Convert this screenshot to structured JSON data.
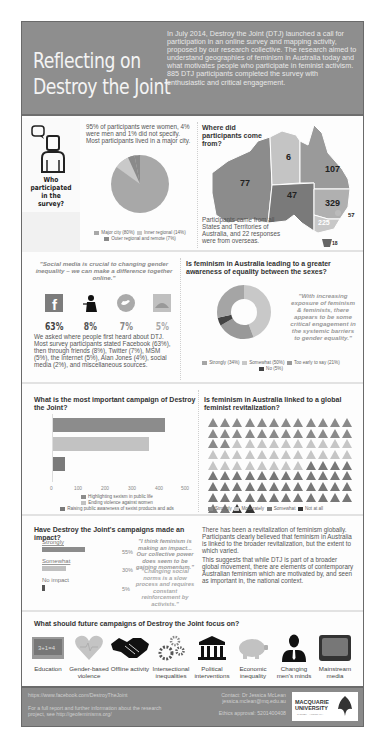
{
  "header": {
    "title": "Reflecting on Destroy the Joint",
    "intro": "In July 2014, Destroy the Joint (DTJ) launched a call for participation in an online survey and mapping activity, proposed by our research collective. The research aimed to understand geographies of feminism in Australia today and what motivates people who participate in feminist activism. 885 DTJ participants completed the survey with enthusiastic and critical engagement."
  },
  "who": {
    "label": "Who participated in the survey?",
    "text": "95% of participants were women, 4% were men and 1% did not specify. Most participants lived in a major city.",
    "legend": [
      "Major city (80%)",
      "Inner regional (14%)",
      "Outer regional and remote (7%)"
    ]
  },
  "where": {
    "title": "Where did participants come from?",
    "states": {
      "WA": "77",
      "NT": "6",
      "QLD": "107",
      "SA": "47",
      "NSW": "329",
      "ACT": "57",
      "VIC": "225",
      "TAS": "18"
    },
    "text": "Participants came from all States and Territories of Australia, and 22 responses were from overseas."
  },
  "social": {
    "quote": "\"Social media is crucial to changing gender inequality – we can make a difference together online.\"",
    "sources": [
      {
        "name": "facebook-icon",
        "pct": "63%"
      },
      {
        "name": "friends-icon",
        "pct": "8%"
      },
      {
        "name": "twitter-icon",
        "pct": "7%"
      },
      {
        "name": "msm-icon",
        "pct": "5%"
      }
    ],
    "text": "We asked where people first heard about DTJ. Most survey participants stated Facebook (63%), then through friends (8%), Twitter (7%), MSM (5%), the Internet (5%), Alan Jones (4%), social media (2%), and miscellaneous sources."
  },
  "awareness": {
    "title": "Is feminism in Australia leading to a greater awareness of equality between the sexes?",
    "quote": "\"With increasing exposure of feminism & feminists, there appears to be some critical engagement in the systemic barriers to gender equality.\"",
    "legend": [
      "Strongly (34%)",
      "Somewhat (50%)",
      "Too early to say (21%)",
      "No (5%)"
    ]
  },
  "chart_data": [
    {
      "type": "pie",
      "title": "Participant location",
      "categories": [
        "Major city",
        "Inner regional",
        "Outer regional and remote"
      ],
      "values": [
        80,
        14,
        7
      ]
    },
    {
      "type": "pie",
      "title": "Is feminism in Australia leading to a greater awareness of equality between the sexes?",
      "categories": [
        "Strongly",
        "Somewhat",
        "Too early to say",
        "No"
      ],
      "values": [
        34,
        50,
        21,
        5
      ]
    },
    {
      "type": "bar",
      "title": "What is the most important campaign of Destroy the Joint?",
      "categories": [
        "Highlighting sexism in public life",
        "Ending violence against women",
        "Raising public awareness of sexist products and ads"
      ],
      "values": [
        420,
        360,
        45
      ],
      "xlim": [
        0,
        500
      ],
      "xticks": [
        "0",
        "100",
        "200",
        "300",
        "400",
        "500"
      ]
    },
    {
      "type": "bar",
      "title": "Have Destroy the Joint's campaigns made an impact?",
      "categories": [
        "Strongly",
        "Somewhat",
        "No impact"
      ],
      "values": [
        55,
        30,
        5
      ]
    }
  ],
  "campaign": {
    "title": "What is the most important campaign of Destroy the Joint?",
    "ticks": [
      "0",
      "100",
      "200",
      "300",
      "400",
      "500"
    ],
    "legend": [
      "Highlighting sexism in public life",
      "Ending violence against women",
      "Raising public awareness of sexist products and ads"
    ]
  },
  "global": {
    "title": "Is feminism in Australia linked to a global feminist revitalization?",
    "legend": [
      "Strongly",
      "Moderately",
      "Somewhat",
      "Not at all"
    ]
  },
  "impact": {
    "title": "Have Destroy the Joint's campaigns made an impact?",
    "rows": [
      {
        "label": "Strongly",
        "pct": "55%"
      },
      {
        "label": "Somewhat",
        "pct": "30%"
      },
      {
        "label": "No impact",
        "pct": "5%"
      }
    ],
    "quote1": "\"I think feminism is making an impact... Our collective power does seem to be gaining momentum.\"",
    "quote2": "\"Changing social norms is a slow process and requires constant reinforcement by activists.\"",
    "text1": "There has been a revitalization of feminism globally. Participants clearly believed that feminism in Australia is linked to the broader revitalization, but the extent to which varied.",
    "text2": "This suggests that while DTJ is part of a broader global movement, there are elements of contemporary Australian feminism which are motivated by, and seen as important in, the national context."
  },
  "focus": {
    "title": "What should future campaigns of Destroy the Joint focus on?",
    "items": [
      "Education",
      "Gender-based violence",
      "Offline activity",
      "Intersectional inequalities",
      "Political interventions",
      "Economic inequality",
      "Changing men's minds",
      "Mainstream media"
    ],
    "chalkboard": "3+1=4"
  },
  "footer": {
    "facebook": "https://www.facebook.com/DestroyTheJoint",
    "report": "For a full report and further information about the research project, see http://geofeminisms.org/",
    "contact": "Contact: Dr Jessica McLean",
    "email": "jessica.mclean@mq.edu.au",
    "ethics": "Ethics approval: 5201400408",
    "logo_line1": "MACQUARIE",
    "logo_line2": "UNIVERSITY",
    "logo_line3": "SYDNEY · AUSTRALIA"
  }
}
